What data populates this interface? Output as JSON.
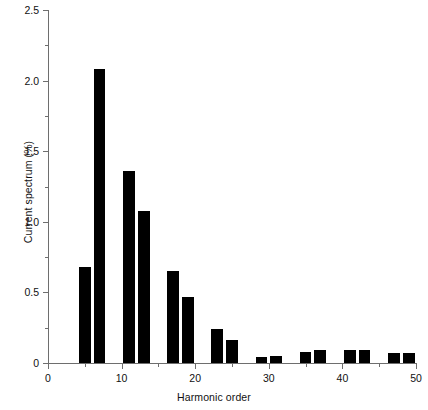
{
  "chart_data": {
    "type": "bar",
    "title": "",
    "xlabel": "Harmonic order",
    "ylabel": "Current spectrum (%)",
    "xlim": [
      0,
      50
    ],
    "ylim": [
      0,
      2.5
    ],
    "grid": false,
    "legend": null,
    "bar_color": "#000000",
    "axis_color": "#6e6e6e",
    "bar_width_units": 1.6,
    "x_ticks": [
      {
        "value": 0,
        "label": "0"
      },
      {
        "value": 10,
        "label": "10"
      },
      {
        "value": 20,
        "label": "20"
      },
      {
        "value": 30,
        "label": "30"
      },
      {
        "value": 40,
        "label": "40"
      },
      {
        "value": 50,
        "label": "50"
      }
    ],
    "x_minor_ticks": [
      5,
      15,
      25,
      35,
      45
    ],
    "y_ticks": [
      {
        "value": 0,
        "label": "0"
      },
      {
        "value": 0.5,
        "label": "0.5"
      },
      {
        "value": 1.0,
        "label": "1.0"
      },
      {
        "value": 1.5,
        "label": "1.5"
      },
      {
        "value": 2.0,
        "label": "2.0"
      },
      {
        "value": 2.5,
        "label": "2.5"
      }
    ],
    "y_minor_ticks": [
      0.25,
      0.75,
      1.25,
      1.75,
      2.25
    ],
    "x": [
      5,
      7,
      11,
      13,
      17,
      19,
      23,
      25,
      29,
      31,
      35,
      37,
      41,
      43,
      47,
      49
    ],
    "values": [
      0.68,
      2.08,
      1.36,
      1.08,
      0.65,
      0.47,
      0.24,
      0.16,
      0.04,
      0.05,
      0.08,
      0.09,
      0.09,
      0.09,
      0.07,
      0.07
    ],
    "categories": [
      "5",
      "7",
      "11",
      "13",
      "17",
      "19",
      "23",
      "25",
      "29",
      "31",
      "35",
      "37",
      "41",
      "43",
      "47",
      "49"
    ]
  }
}
